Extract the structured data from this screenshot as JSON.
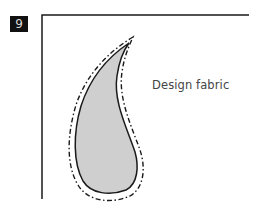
{
  "step": {
    "number": "9"
  },
  "diagram": {
    "label": "Design fabric",
    "colors": {
      "fill": "#cfcfcf",
      "outline": "#1a1a1a",
      "frame": "#1a1a1a",
      "badge_bg": "#111111",
      "badge_text": "#d8d8d8"
    },
    "shapes": [
      "fabric-frame",
      "paisley-shape",
      "seam-allowance-dashed-outline"
    ]
  }
}
